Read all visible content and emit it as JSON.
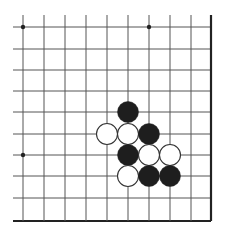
{
  "board": {
    "description": "Go board corner diagram (lower-right edge visible)",
    "columns": 10,
    "rows": 10,
    "col_x": [
      23,
      44,
      65,
      86,
      107,
      128,
      149,
      170,
      191,
      211
    ],
    "row_y": [
      27,
      49,
      70,
      91,
      112,
      134,
      155,
      176,
      198,
      221
    ],
    "line_color": "#555555",
    "edge_color": "#222222",
    "star_points": [
      {
        "col": 0,
        "row": 0
      },
      {
        "col": 6,
        "row": 0
      },
      {
        "col": 0,
        "row": 6
      }
    ],
    "stone_radius": 10.5,
    "colors": {
      "black": "#1e1e1e",
      "white": "#ffffff",
      "white_outline": "#333333"
    },
    "stones": [
      {
        "color": "black",
        "col": 5,
        "row": 4
      },
      {
        "color": "white",
        "col": 4,
        "row": 5
      },
      {
        "color": "white",
        "col": 5,
        "row": 5
      },
      {
        "color": "black",
        "col": 6,
        "row": 5
      },
      {
        "color": "black",
        "col": 5,
        "row": 6
      },
      {
        "color": "white",
        "col": 6,
        "row": 6
      },
      {
        "color": "white",
        "col": 7,
        "row": 6
      },
      {
        "color": "white",
        "col": 5,
        "row": 7
      },
      {
        "color": "black",
        "col": 6,
        "row": 7
      },
      {
        "color": "black",
        "col": 7,
        "row": 7
      }
    ]
  }
}
